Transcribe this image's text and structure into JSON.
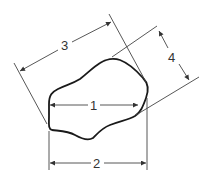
{
  "diagram": {
    "colors": {
      "outline": "#1a1a1a",
      "lines": "#444444",
      "text": "#333333",
      "background": "#ffffff"
    },
    "dimensions": [
      {
        "id": "1",
        "label": "1",
        "type": "horizontal inner chord"
      },
      {
        "id": "2",
        "label": "2",
        "type": "horizontal projected width"
      },
      {
        "id": "3",
        "label": "3",
        "type": "oblique length"
      },
      {
        "id": "4",
        "label": "4",
        "type": "oblique width"
      }
    ]
  }
}
